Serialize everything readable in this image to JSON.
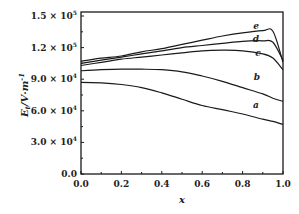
{
  "chart_data": {
    "type": "line",
    "title": "",
    "xlabel": "x",
    "ylabel": "E_t / V·m⁻¹",
    "xlim": [
      0.0,
      1.0
    ],
    "ylim": [
      0.0,
      160000.0
    ],
    "grid": false,
    "legend": "inline curve labels a–e near right edge",
    "x_ticks": [
      "0.0",
      "0.2",
      "0.4",
      "0.6",
      "0.8",
      "1.0"
    ],
    "y_ticks": [
      "0.0",
      "3.0 × 10⁴",
      "6.0 × 10⁴",
      "9.0 × 10⁴",
      "1.2 × 10⁵",
      "1.5 × 10⁵"
    ],
    "y_tick_values": [
      0,
      30000,
      60000,
      90000,
      120000,
      150000
    ],
    "x": [
      0.0,
      0.1,
      0.2,
      0.3,
      0.4,
      0.5,
      0.6,
      0.7,
      0.8,
      0.9,
      0.95,
      1.0
    ],
    "series": [
      {
        "name": "a",
        "values": [
          87000,
          86500,
          85000,
          82000,
          77000,
          71000,
          65000,
          61000,
          57000,
          52000,
          50000,
          47000
        ]
      },
      {
        "name": "b",
        "values": [
          98000,
          99000,
          99500,
          99500,
          99000,
          97000,
          93000,
          88000,
          82000,
          76000,
          72000,
          69000
        ]
      },
      {
        "name": "c",
        "values": [
          103000,
          106000,
          109000,
          111000,
          113000,
          115000,
          117000,
          117500,
          117000,
          114000,
          110000,
          99000
        ]
      },
      {
        "name": "d",
        "values": [
          105000,
          108000,
          111000,
          114000,
          117000,
          120000,
          122000,
          124000,
          126000,
          126500,
          125000,
          108000
        ]
      },
      {
        "name": "e",
        "values": [
          107000,
          110000,
          112000,
          116000,
          119000,
          123000,
          127000,
          131000,
          134000,
          136000,
          135500,
          106000
        ]
      }
    ]
  },
  "axes": {
    "x_label": "x",
    "y_label_main": "E",
    "y_label_sub": "t",
    "y_label_units": "/V·m",
    "y_label_exp": "-1",
    "x_ticks": [
      "0.0",
      "0.2",
      "0.4",
      "0.6",
      "0.8",
      "1.0"
    ],
    "y_ticks": [
      {
        "mant": "0.0",
        "exp": ""
      },
      {
        "mant": "3.0 × 10",
        "exp": "4"
      },
      {
        "mant": "6.0 × 10",
        "exp": "4"
      },
      {
        "mant": "9.0 × 10",
        "exp": "4"
      },
      {
        "mant": "1.2 × 10",
        "exp": "5"
      },
      {
        "mant": "1.5 × 10",
        "exp": "5"
      }
    ]
  },
  "curve_labels": [
    "a",
    "b",
    "c",
    "d",
    "e"
  ]
}
